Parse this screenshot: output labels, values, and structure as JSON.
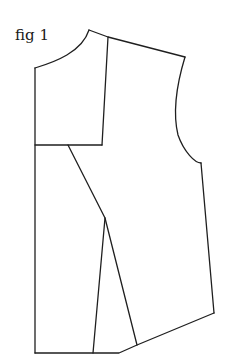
{
  "figure": {
    "label": "fig 1",
    "stroke_color": "#1f1f1f",
    "background_color": "#ffffff"
  }
}
